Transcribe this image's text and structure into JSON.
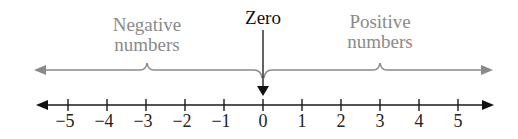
{
  "diagram": {
    "labels": {
      "negative_line1": "Negative",
      "negative_line2": "numbers",
      "zero": "Zero",
      "positive_line1": "Positive",
      "positive_line2": "numbers"
    },
    "ticks": [
      {
        "value": -5,
        "label": "−5"
      },
      {
        "value": -4,
        "label": "−4"
      },
      {
        "value": -3,
        "label": "−3"
      },
      {
        "value": -2,
        "label": "−2"
      },
      {
        "value": -1,
        "label": "−1"
      },
      {
        "value": 0,
        "label": "0"
      },
      {
        "value": 1,
        "label": "1"
      },
      {
        "value": 2,
        "label": "2"
      },
      {
        "value": 3,
        "label": "3"
      },
      {
        "value": 4,
        "label": "4"
      },
      {
        "value": 5,
        "label": "5"
      }
    ],
    "colors": {
      "annotation_gray": "#8a8a8a",
      "axis_black": "#1a1a1a"
    }
  }
}
